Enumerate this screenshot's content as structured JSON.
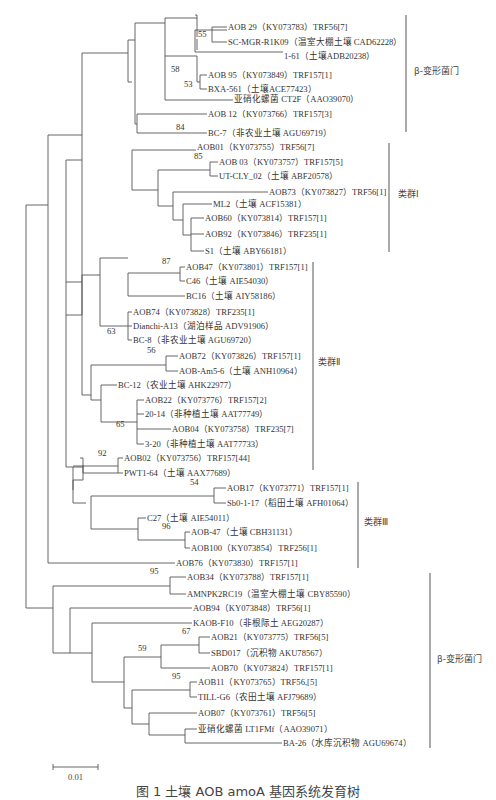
{
  "figure": {
    "caption": "图 1  土壤 AOB amoA 基因系统发育树",
    "scale_bar": {
      "label": "0.01"
    }
  },
  "leaves": [
    {
      "label": "AOB 29（KY073783）TRF56[7]",
      "x": 227,
      "y": 27
    },
    {
      "label": "SC-MGR-R1K09（温室大棚土壤 CAD62228）",
      "x": 227,
      "y": 42
    },
    {
      "label": "1-61（土壤ADB20238）",
      "x": 283,
      "y": 56
    },
    {
      "label": "AOB 95（KY073849）TRF157[1]",
      "x": 207,
      "y": 75
    },
    {
      "label": "BXA-561（土壤ACE77423）",
      "x": 207,
      "y": 89
    },
    {
      "label": "亚硝化螺菌 CT2F（AAO39070）",
      "x": 233,
      "y": 99
    },
    {
      "label": "AOB 12（KY073766）TRF157[3]",
      "x": 207,
      "y": 114
    },
    {
      "label": "BC-7（非农业土壤  AGU69719）",
      "x": 207,
      "y": 133
    },
    {
      "label": "AOB01（KY073755）TRF56[7]",
      "x": 196,
      "y": 147
    },
    {
      "label": "AOB 03（KY073757）TRF157[5]",
      "x": 218,
      "y": 162
    },
    {
      "label": "UT-CLY_02（土壤  ABF20578）",
      "x": 218,
      "y": 176
    },
    {
      "label": "AOB73（KY073827）TRF56[1]",
      "x": 268,
      "y": 192
    },
    {
      "label": "ML2（土壤  ACF15381）",
      "x": 212,
      "y": 204
    },
    {
      "label": "AOB60（KY073814）TRF157[1]",
      "x": 204,
      "y": 218
    },
    {
      "label": "AOB92（KY073846）TRF235[1]",
      "x": 204,
      "y": 234
    },
    {
      "label": "S1（土壤  ABY66181）",
      "x": 204,
      "y": 251
    },
    {
      "label": "AOB47（KY073801）TRF157[1]",
      "x": 185,
      "y": 267
    },
    {
      "label": "C46（土壤  AIE54030）",
      "x": 185,
      "y": 281
    },
    {
      "label": "BC16（土壤  AIY58186）",
      "x": 185,
      "y": 296
    },
    {
      "label": "AOB74（KY073828）TRF235[1]",
      "x": 132,
      "y": 312
    },
    {
      "label": "Dianchi-A13（湖泊样品  ADV91906）",
      "x": 132,
      "y": 326
    },
    {
      "label": "BC-8（非农业土壤  AGU69720）",
      "x": 132,
      "y": 340
    },
    {
      "label": "AOB72（KY073826）TRF157[1]",
      "x": 178,
      "y": 356
    },
    {
      "label": "AOB-Am5-6（土壤  ANH10964）",
      "x": 178,
      "y": 371
    },
    {
      "label": "BC-12（农业土壤  AHK22977）",
      "x": 117,
      "y": 385
    },
    {
      "label": "AOB22（KY073776）TRF157[2]",
      "x": 144,
      "y": 400
    },
    {
      "label": "20-14（非种植土壤  AAT77749）",
      "x": 144,
      "y": 414
    },
    {
      "label": "AOB04（KY073758）TRF235[7]",
      "x": 171,
      "y": 429
    },
    {
      "label": "3-20（非种植土壤  AAT77733）",
      "x": 144,
      "y": 444
    },
    {
      "label": "AOB02（KY073756）TRF157[44]",
      "x": 123,
      "y": 458
    },
    {
      "label": "PWT1-64（土壤  AAX77689）",
      "x": 123,
      "y": 473
    },
    {
      "label": "AOB17（KY073771）TRF157[1]",
      "x": 226,
      "y": 488
    },
    {
      "label": "Sb0-1-17（稻田土壤  AFH01064）",
      "x": 226,
      "y": 503
    },
    {
      "label": "C27（土壤  AIE54011）",
      "x": 146,
      "y": 518
    },
    {
      "label": "AOB-47（土壤  CBH31131）",
      "x": 190,
      "y": 532
    },
    {
      "label": "AOB100（KY073854）TRF256[1]",
      "x": 190,
      "y": 548
    },
    {
      "label": "AOB76（KY073830）TRF157[1]",
      "x": 175,
      "y": 563
    },
    {
      "label": "AOB34（KY073788）TRF157[1]",
      "x": 186,
      "y": 577
    },
    {
      "label": "AMNPK2RC19（温室大棚土壤  CBY85590）",
      "x": 186,
      "y": 594
    },
    {
      "label": "AOB94（KY073848）TRF56[1]",
      "x": 192,
      "y": 608
    },
    {
      "label": "KAOB-F10（非根际土  AEG20287）",
      "x": 192,
      "y": 623
    },
    {
      "label": "AOB21（KY073775）TRF56[5]",
      "x": 210,
      "y": 637
    },
    {
      "label": "SBD017（沉积物  AKU78567）",
      "x": 210,
      "y": 653
    },
    {
      "label": "AOB70（KY073824）TRF157[1]",
      "x": 210,
      "y": 668
    },
    {
      "label": "AOB11（KY073765）TRF56,[5]",
      "x": 197,
      "y": 682
    },
    {
      "label": "TILL-G6（农田土壤  AFJ79689）",
      "x": 197,
      "y": 697
    },
    {
      "label": "AOB07（KY073761）TRF56[5]",
      "x": 197,
      "y": 713
    },
    {
      "label": "亚硝化螺菌 LT1FMf（AAO39071）",
      "x": 197,
      "y": 729
    },
    {
      "label": "BA-26（水库沉积物  AGU69674）",
      "x": 282,
      "y": 743
    }
  ],
  "bootstrap": [
    {
      "value": "55",
      "x": 208,
      "y": 34
    },
    {
      "value": "58",
      "x": 181,
      "y": 69
    },
    {
      "value": "53",
      "x": 194,
      "y": 84
    },
    {
      "value": "84",
      "x": 186,
      "y": 127
    },
    {
      "value": "85",
      "x": 204,
      "y": 156
    },
    {
      "value": "87",
      "x": 172,
      "y": 261
    },
    {
      "value": "63",
      "x": 117,
      "y": 331
    },
    {
      "value": "56",
      "x": 157,
      "y": 350
    },
    {
      "value": "65",
      "x": 126,
      "y": 424
    },
    {
      "value": "92",
      "x": 108,
      "y": 453
    },
    {
      "value": "54",
      "x": 200,
      "y": 482
    },
    {
      "value": "96",
      "x": 172,
      "y": 526
    },
    {
      "value": "95",
      "x": 160,
      "y": 571
    },
    {
      "value": "67",
      "x": 192,
      "y": 631
    },
    {
      "value": "59",
      "x": 148,
      "y": 648
    },
    {
      "value": "95",
      "x": 182,
      "y": 676
    }
  ],
  "groups": [
    {
      "label": "β-变形菌门",
      "bar_x": 406,
      "y1": 15,
      "y2": 132,
      "label_x": 414,
      "label_y": 70
    },
    {
      "label": "类群Ⅰ",
      "bar_x": 389,
      "y1": 143,
      "y2": 252,
      "label_x": 398,
      "label_y": 193
    },
    {
      "label": "类群Ⅱ",
      "bar_x": 313,
      "y1": 262,
      "y2": 470,
      "label_x": 318,
      "label_y": 361
    },
    {
      "label": "类群Ⅲ",
      "bar_x": 358,
      "y1": 482,
      "y2": 568,
      "label_x": 364,
      "label_y": 521
    },
    {
      "label": "β-变形菌门",
      "bar_x": 430,
      "y1": 573,
      "y2": 748,
      "label_x": 437,
      "label_y": 658
    }
  ],
  "chart_data": {
    "type": "phylogenetic_tree",
    "title": "土壤 AOB amoA 基因系统发育树",
    "scale_bar": 0.01,
    "clades": [
      {
        "name": "β-变形菌门",
        "members": [
          "AOB 29（KY073783）TRF56[7]",
          "SC-MGR-R1K09（温室大棚土壤 CAD62228）",
          "1-61（土壤ADB20238）",
          "AOB 95（KY073849）TRF157[1]",
          "BXA-561（土壤ACE77423）",
          "亚硝化螺菌 CT2F（AAO39070）",
          "AOB 12（KY073766）TRF157[3]",
          "BC-7（非农业土壤 AGU69719）"
        ]
      },
      {
        "name": "类群Ⅰ",
        "members": [
          "AOB01（KY073755）TRF56[7]",
          "AOB 03（KY073757）TRF157[5]",
          "UT-CLY_02（土壤 ABF20578）",
          "AOB73（KY073827）TRF56[1]",
          "ML2（土壤 ACF15381）",
          "AOB60（KY073814）TRF157[1]",
          "AOB92（KY073846）TRF235[1]",
          "S1（土壤 ABY66181）"
        ]
      },
      {
        "name": "类群Ⅱ",
        "members": [
          "AOB47（KY073801）TRF157[1]",
          "C46（土壤 AIE54030）",
          "BC16（土壤 AIY58186）",
          "AOB74（KY073828）TRF235[1]",
          "Dianchi-A13（湖泊样品 ADV91906）",
          "BC-8（非农业土壤 AGU69720）",
          "AOB72（KY073826）TRF157[1]",
          "AOB-Am5-6（土壤 ANH10964）",
          "BC-12（农业土壤 AHK22977）",
          "AOB22（KY073776）TRF157[2]",
          "20-14（非种植土壤 AAT77749）",
          "AOB04（KY073758）TRF235[7]",
          "3-20（非种植土壤 AAT77733）",
          "AOB02（KY073756）TRF157[44]",
          "PWT1-64（土壤 AAX77689）"
        ]
      },
      {
        "name": "类群Ⅲ",
        "members": [
          "AOB17（KY073771）TRF157[1]",
          "Sb0-1-17（稻田土壤 AFH01064）",
          "C27（土壤 AIE54011）",
          "AOB-47（土壤 CBH31131）",
          "AOB100（KY073854）TRF256[1]",
          "AOB76（KY073830）TRF157[1]"
        ]
      },
      {
        "name": "β-变形菌门",
        "members": [
          "AOB34（KY073788）TRF157[1]",
          "AMNPK2RC19（温室大棚土壤 CBY85590）",
          "AOB94（KY073848）TRF56[1]",
          "KAOB-F10（非根际土 AEG20287）",
          "AOB21（KY073775）TRF56[5]",
          "SBD017（沉积物 AKU78567）",
          "AOB70（KY073824）TRF157[1]",
          "AOB11（KY073765）TRF56,[5]",
          "TILL-G6（农田土壤 AFJ79689）",
          "AOB07（KY073761）TRF56[5]",
          "亚硝化螺菌 LT1FMf（AAO39071）",
          "BA-26（水库沉积物 AGU69674）"
        ]
      }
    ],
    "bootstrap_values": [
      55,
      58,
      53,
      84,
      85,
      87,
      63,
      56,
      65,
      92,
      54,
      96,
      95,
      67,
      59,
      95
    ]
  }
}
